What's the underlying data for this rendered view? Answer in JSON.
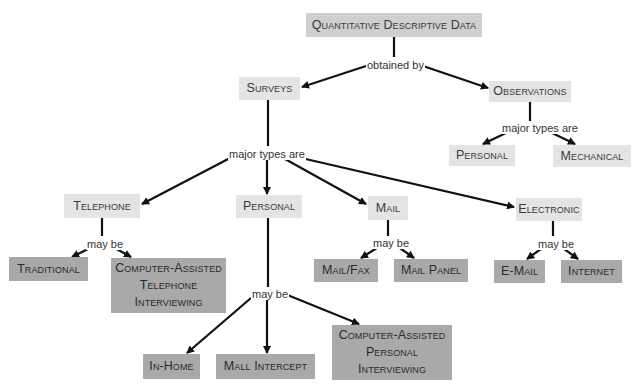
{
  "diagram": {
    "root": {
      "label": "Quantitative Descriptive Data"
    },
    "link_obtained_by": "obtained by",
    "surveys": {
      "label": "Surveys",
      "link": "major types are",
      "types": {
        "telephone": {
          "label": "Telephone",
          "link": "may be",
          "children": [
            "Traditional",
            "Computer-Assisted\nTelephone\nInterviewing"
          ]
        },
        "personal": {
          "label": "Personal",
          "link": "may be",
          "children": [
            "In-Home",
            "Mall Intercept",
            "Computer-Assisted\nPersonal\nInterviewing"
          ]
        },
        "mail": {
          "label": "Mail",
          "link": "may be",
          "children": [
            "Mail/Fax",
            "Mail Panel"
          ]
        },
        "electronic": {
          "label": "Electronic",
          "link": "may be",
          "children": [
            "E-Mail",
            "Internet"
          ]
        }
      }
    },
    "observations": {
      "label": "Observations",
      "link": "major types are",
      "children": [
        "Personal",
        "Mechanical"
      ]
    }
  },
  "colors": {
    "root_fill": "#cfcfcf",
    "intermediate_fill": "#e4e4e4",
    "leaf_fill": "#a9a9a9",
    "line": "#111111"
  }
}
